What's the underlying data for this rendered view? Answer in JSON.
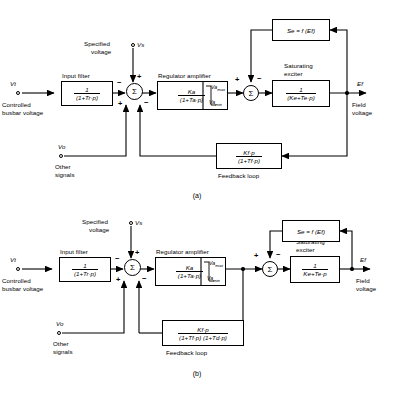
{
  "figure": {
    "captions": {
      "a": "(a)",
      "b": "(b)"
    }
  },
  "diagram_a": {
    "caption": "(a)",
    "terminals": [
      {
        "name": "input-terminal-vt",
        "symbol": "Vt",
        "description_line1": "Controlled",
        "description_line2": "busbar voltage"
      },
      {
        "name": "terminal-vs",
        "symbol": "Vs",
        "description_line1": "Specified",
        "description_line2": "voltage"
      },
      {
        "name": "terminal-vo",
        "symbol": "Vo",
        "description_line1": "Other",
        "description_line2": "signals"
      }
    ],
    "output": {
      "symbol": "Ef",
      "description_line1": "Field",
      "description_line2": "voltage"
    },
    "blocks": [
      {
        "name": "input-filter",
        "title": "Input filter",
        "numerator": "1",
        "denominator": "(1+Tr·p)"
      },
      {
        "name": "regulator-amplifier",
        "title": "Regulator amplifier",
        "numerator": "Ka",
        "denominator": "(1+Ta·p)",
        "limit_max": "Vamax",
        "limit_min": "Vamin"
      },
      {
        "name": "saturating-exciter",
        "title_line1": "Saturating",
        "title_line2": "exciter",
        "numerator": "1",
        "denominator": "(Ke+Te·p)"
      },
      {
        "name": "saturation-function",
        "expression": "Se = f (Ef)"
      },
      {
        "name": "feedback-loop",
        "title": "Feedback loop",
        "numerator": "Kf·p",
        "denominator": "(1+Tf·p)"
      }
    ],
    "summing_junction_1": {
      "symbol": "Σ",
      "sign_top": "+",
      "sign_left": "−",
      "sign_bottom_left": "+",
      "sign_bottom_right": "−"
    },
    "summing_junction_2": {
      "symbol": "Σ",
      "sign_left": "+",
      "sign_top": "−"
    }
  },
  "diagram_b": {
    "caption": "(b)",
    "terminals": [
      {
        "name": "input-terminal-vt",
        "symbol": "Vt",
        "description_line1": "Controlled",
        "description_line2": "busbar voltage"
      },
      {
        "name": "terminal-vs",
        "symbol": "Vs",
        "description_line1": "Specified",
        "description_line2": "voltage"
      },
      {
        "name": "terminal-vo",
        "symbol": "Vo",
        "description_line1": "Other",
        "description_line2": "signals"
      }
    ],
    "output": {
      "symbol": "Ef",
      "description_line1": "Field",
      "description_line2": "voltage"
    },
    "blocks": [
      {
        "name": "input-filter",
        "title": "Input filter",
        "numerator": "1",
        "denominator": "(1+Tr·p)"
      },
      {
        "name": "regulator-amplifier",
        "title": "Regulator amplifier",
        "numerator": "Ka",
        "denominator": "(1+Ta·p)",
        "limit_max": "Vamax",
        "limit_min": "Vamin"
      },
      {
        "name": "saturating-exciter",
        "title_line1": "Saturating",
        "title_line2": "exciter",
        "numerator": "1",
        "denominator": "Ke+Te·p"
      },
      {
        "name": "saturation-function",
        "expression": "Se = f (Ef)"
      },
      {
        "name": "feedback-loop",
        "title": "Feedback loop",
        "numerator": "Kf·p",
        "denominator": "(1+Tf·p) (1+Td·p)"
      }
    ],
    "summing_junction_1": {
      "symbol": "Σ",
      "sign_top": "+",
      "sign_left": "−",
      "sign_bottom_left": "+",
      "sign_bottom_right": "−"
    },
    "summing_junction_2": {
      "symbol": "Σ",
      "sign_left": "+",
      "sign_top": "−"
    }
  }
}
